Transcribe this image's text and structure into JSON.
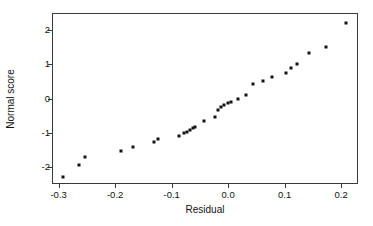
{
  "chart_data": {
    "type": "scatter",
    "title": "",
    "xlabel": "Residual",
    "ylabel": "Normal score",
    "xlim": [
      -0.31,
      0.228
    ],
    "ylim": [
      -2.47,
      2.47
    ],
    "xticks": [
      -0.3,
      -0.2,
      -0.1,
      0.0,
      0.1,
      0.2
    ],
    "xticklabels": [
      "-0.3",
      "-0.2",
      "-0.1",
      "0.0",
      "0.1",
      "0.2"
    ],
    "yticks": [
      2,
      1,
      0,
      -1,
      -2
    ],
    "yticklabels": [
      "2",
      "1",
      "0",
      "-1",
      "-2"
    ],
    "grid": false,
    "legend": null,
    "marker": "square",
    "marker_color": "#141414",
    "frame_color": "#3a3a3a",
    "background": "#ffffff",
    "n_points": 31,
    "x": [
      -0.292,
      -0.264,
      -0.254,
      -0.189,
      -0.168,
      -0.132,
      -0.124,
      -0.087,
      -0.079,
      -0.073,
      -0.068,
      -0.062,
      -0.058,
      -0.042,
      -0.023,
      -0.018,
      -0.012,
      -0.007,
      -0.001,
      0.005,
      0.018,
      0.032,
      0.044,
      0.061,
      0.078,
      0.102,
      0.112,
      0.121,
      0.143,
      0.174,
      0.209
    ],
    "y": [
      -2.29,
      -1.94,
      -1.71,
      -1.54,
      -1.41,
      -1.27,
      -1.18,
      -1.1,
      -1.02,
      -0.98,
      -0.93,
      -0.87,
      -0.84,
      -0.66,
      -0.55,
      -0.35,
      -0.26,
      -0.19,
      -0.14,
      -0.1,
      -0.02,
      0.11,
      0.42,
      0.51,
      0.64,
      0.74,
      0.88,
      1.01,
      1.32,
      1.52,
      2.21
    ]
  }
}
